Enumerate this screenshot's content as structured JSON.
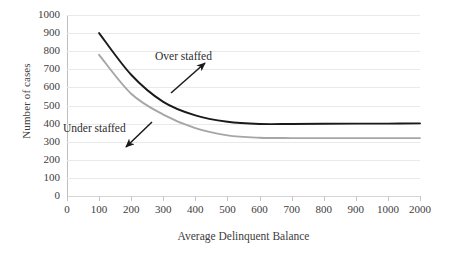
{
  "chart_data": {
    "type": "line",
    "title": "",
    "subtitle": "",
    "xlabel": "Average Delinquent Balance",
    "ylabel": "Number of cases",
    "grid": true,
    "legend_position": "none",
    "x_categories": [
      "0",
      "100",
      "200",
      "300",
      "400",
      "500",
      "600",
      "700",
      "800",
      "900",
      "1000",
      "2000"
    ],
    "y_ticks": [
      "0",
      "100",
      "200",
      "300",
      "400",
      "500",
      "600",
      "700",
      "800",
      "900",
      "1000"
    ],
    "ylim": [
      0,
      1000
    ],
    "series": [
      {
        "name": "Over staffed",
        "color": "#1a1a1a",
        "x": [
          "100",
          "200",
          "300",
          "400",
          "500",
          "600",
          "700",
          "800",
          "900",
          "1000",
          "2000"
        ],
        "values": [
          900,
          670,
          520,
          445,
          410,
          398,
          398,
          399,
          400,
          400,
          401
        ]
      },
      {
        "name": "Under staffed",
        "color": "#a6a6a6",
        "x": [
          "100",
          "200",
          "300",
          "400",
          "500",
          "600",
          "700",
          "800",
          "900",
          "1000",
          "2000"
        ],
        "values": [
          780,
          565,
          450,
          375,
          335,
          322,
          320,
          320,
          320,
          320,
          320
        ]
      }
    ],
    "annotations": [
      {
        "label": "Over staffed",
        "arrow": "arrow-up-right",
        "points_to_series": "Over staffed"
      },
      {
        "label": "Under staffed",
        "arrow": "arrow-down-left",
        "points_to_series": "Under staffed"
      }
    ]
  }
}
